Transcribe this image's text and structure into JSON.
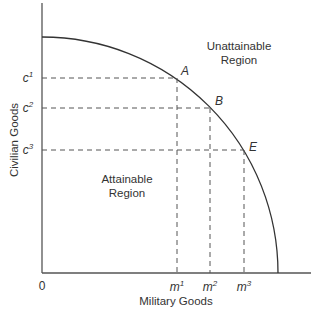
{
  "diagram": {
    "x_axis_label": "Military Goods",
    "y_axis_label": "Civilian Goods",
    "origin_label": "0",
    "regions": {
      "unattainable_line1": "Unattainable",
      "unattainable_line2": "Region",
      "attainable_line1": "Attainable",
      "attainable_line2": "Region"
    },
    "points": [
      {
        "label": "A",
        "m": "m",
        "m_sup": "1",
        "c": "c",
        "c_sup": "1"
      },
      {
        "label": "B",
        "m": "m",
        "m_sup": "2",
        "c": "c",
        "c_sup": "2"
      },
      {
        "label": "E",
        "m": "m",
        "m_sup": "3",
        "c": "c",
        "c_sup": "3"
      }
    ],
    "colors": {
      "axis": "#555555",
      "curve": "#333333",
      "dash": "#555555",
      "text": "#333333"
    }
  }
}
